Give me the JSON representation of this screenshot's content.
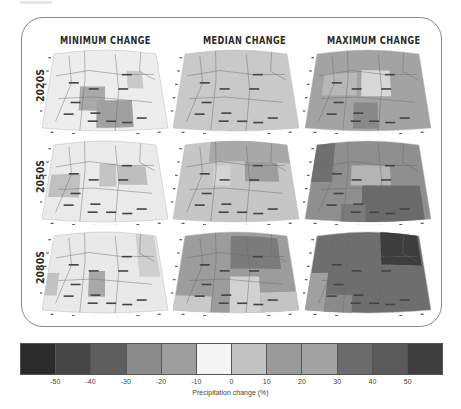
{
  "columns": [
    {
      "title": "MINIMUM CHANGE",
      "x": 60
    },
    {
      "title": "MEDIAN CHANGE",
      "x": 203
    },
    {
      "title": "MAXIMUM CHANGE",
      "x": 327
    }
  ],
  "rows": [
    {
      "label": "2020S",
      "y": 85
    },
    {
      "label": "2050S",
      "y": 176
    },
    {
      "label": "2080S",
      "y": 267
    }
  ],
  "colorbar": {
    "label": "Precipitation change (%)",
    "colors": [
      "#2b2b2b",
      "#454545",
      "#5e5e5e",
      "#8c8c8c",
      "#9e9e9e",
      "#f5f5f5",
      "#c2c2c2",
      "#9a9a9a",
      "#a3a3a3",
      "#6c6c6c",
      "#5a5a5a",
      "#3e3e3e"
    ],
    "ticks": [
      "-50",
      "-40",
      "-30",
      "-20",
      "-10",
      "0",
      "10",
      "20",
      "30",
      "40",
      "50"
    ]
  },
  "chart_data": {
    "type": "heatmap",
    "column_headers": [
      "MINIMUM CHANGE",
      "MEDIAN CHANGE",
      "MAXIMUM CHANGE"
    ],
    "row_headers": [
      "2020S",
      "2050S",
      "2080S"
    ],
    "colorbar_label": "Precipitation change (%)",
    "colorbar_ticks": [
      -50,
      -40,
      -30,
      -20,
      -10,
      0,
      10,
      20,
      30,
      40,
      50
    ],
    "value_range": [
      -60,
      60
    ],
    "panels": [
      {
        "row": "2020S",
        "col": "MINIMUM CHANGE",
        "base": "#ededed",
        "blocks": [
          {
            "x": 0.28,
            "y": 0.45,
            "w": 0.22,
            "h": 0.3,
            "c": "#a9a9a9"
          },
          {
            "x": 0.43,
            "y": 0.62,
            "w": 0.3,
            "h": 0.34,
            "c": "#a0a0a0"
          },
          {
            "x": 0.7,
            "y": 0.25,
            "w": 0.14,
            "h": 0.22,
            "c": "#c9c9c9"
          }
        ]
      },
      {
        "row": "2020S",
        "col": "MEDIAN CHANGE",
        "base": "#c9c9c9",
        "blocks": []
      },
      {
        "row": "2020S",
        "col": "MAXIMUM CHANGE",
        "base": "#a3a3a3",
        "blocks": [
          {
            "x": 0.1,
            "y": 0.28,
            "w": 0.3,
            "h": 0.28,
            "c": "#b8b8b8"
          },
          {
            "x": 0.44,
            "y": 0.25,
            "w": 0.26,
            "h": 0.32,
            "c": "#d8d8d8"
          },
          {
            "x": 0.38,
            "y": 0.65,
            "w": 0.2,
            "h": 0.32,
            "c": "#888888"
          }
        ]
      },
      {
        "row": "2050S",
        "col": "MINIMUM CHANGE",
        "base": "#eaeaea",
        "blocks": [
          {
            "x": 0.02,
            "y": 0.4,
            "w": 0.26,
            "h": 0.3,
            "c": "#c0c0c0"
          },
          {
            "x": 0.45,
            "y": 0.28,
            "w": 0.15,
            "h": 0.28,
            "c": "#c4c4c4"
          },
          {
            "x": 0.62,
            "y": 0.3,
            "w": 0.25,
            "h": 0.24,
            "c": "#bdbdbd"
          }
        ]
      },
      {
        "row": "2050S",
        "col": "MEDIAN CHANGE",
        "base": "#c6c6c6",
        "blocks": [
          {
            "x": 0.25,
            "y": 0.0,
            "w": 0.75,
            "h": 0.25,
            "c": "#a8a8a8"
          },
          {
            "x": 0.58,
            "y": 0.25,
            "w": 0.3,
            "h": 0.25,
            "c": "#9e9e9e"
          },
          {
            "x": 0.3,
            "y": 0.3,
            "w": 0.15,
            "h": 0.25,
            "c": "#d4d4d4"
          }
        ]
      },
      {
        "row": "2050S",
        "col": "MAXIMUM CHANGE",
        "base": "#8f8f8f",
        "blocks": [
          {
            "x": 0.0,
            "y": 0.0,
            "w": 0.18,
            "h": 0.5,
            "c": "#6f6f6f"
          },
          {
            "x": 0.35,
            "y": 0.3,
            "w": 0.35,
            "h": 0.25,
            "c": "#b4b4b4"
          },
          {
            "x": 0.45,
            "y": 0.55,
            "w": 0.5,
            "h": 0.45,
            "c": "#6a6a6a"
          },
          {
            "x": 0.28,
            "y": 0.78,
            "w": 0.2,
            "h": 0.22,
            "c": "#7a7a7a"
          }
        ]
      },
      {
        "row": "2080S",
        "col": "MINIMUM CHANGE",
        "base": "#e9e9e9",
        "blocks": [
          {
            "x": 0.0,
            "y": 0.5,
            "w": 0.1,
            "h": 0.3,
            "c": "#c2c2c2"
          },
          {
            "x": 0.36,
            "y": 0.48,
            "w": 0.14,
            "h": 0.32,
            "c": "#a8a8a8"
          },
          {
            "x": 0.8,
            "y": 0.0,
            "w": 0.18,
            "h": 0.55,
            "c": "#cfcfcf"
          }
        ]
      },
      {
        "row": "2080S",
        "col": "MEDIAN CHANGE",
        "base": "#9c9c9c",
        "blocks": [
          {
            "x": 0.45,
            "y": 0.05,
            "w": 0.45,
            "h": 0.4,
            "c": "#7b7b7b"
          },
          {
            "x": 0.0,
            "y": 0.8,
            "w": 0.3,
            "h": 0.2,
            "c": "#c9c9c9"
          },
          {
            "x": 0.45,
            "y": 0.55,
            "w": 0.25,
            "h": 0.45,
            "c": "#d2d2d2"
          },
          {
            "x": 0.7,
            "y": 0.75,
            "w": 0.3,
            "h": 0.25,
            "c": "#c4c4c4"
          }
        ]
      },
      {
        "row": "2080S",
        "col": "MAXIMUM CHANGE",
        "base": "#6e6e6e",
        "blocks": [
          {
            "x": 0.62,
            "y": 0.0,
            "w": 0.36,
            "h": 0.4,
            "c": "#3d3d3d"
          },
          {
            "x": 0.0,
            "y": 0.5,
            "w": 0.15,
            "h": 0.5,
            "c": "#a0a0a0"
          },
          {
            "x": 0.15,
            "y": 0.78,
            "w": 0.22,
            "h": 0.22,
            "c": "#8a8a8a"
          }
        ]
      }
    ]
  }
}
